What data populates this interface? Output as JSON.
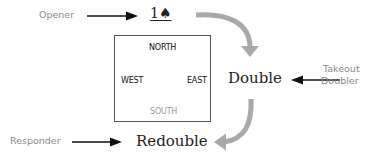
{
  "diagram": {
    "roles": {
      "opener": "Opener",
      "takeout_doubler_line1": "Takeout",
      "takeout_doubler_line2": "Doubler",
      "responder": "Responder"
    },
    "bids": {
      "opening": "1♠",
      "double": "Double",
      "redouble": "Redouble"
    },
    "table": {
      "north": "NORTH",
      "west": "WEST",
      "east": "EAST",
      "south": "SOUTH"
    },
    "colors": {
      "curved_arrow": "#a9a9a9",
      "role_text": "#8a8a8a",
      "south_text": "#9a9a9a",
      "pointer_arrow": "#111111"
    }
  }
}
